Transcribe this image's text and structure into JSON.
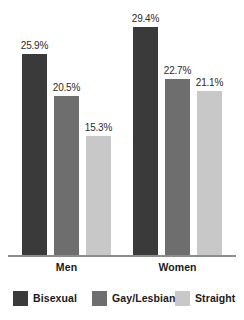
{
  "chart_data": {
    "type": "bar",
    "title": "",
    "subtitle": "",
    "xlabel": "",
    "ylabel": "",
    "categories": [
      "Men",
      "Women"
    ],
    "series": [
      {
        "name": "Bisexual",
        "color": "#3a3a3a",
        "values": [
          25.9,
          20.5
        ],
        "labels": [
          "25.9%",
          "15.3%"
        ]
      },
      {
        "name": "Gay/Lesbian",
        "color": "#6e6e6e",
        "values": [
          20.5,
          22.7
        ],
        "labels": [
          "20.5%",
          "22.7%"
        ]
      },
      {
        "name": "Straight",
        "color": "#c8c8c8",
        "values": [
          15.3,
          21.1
        ],
        "labels": [
          "15.3%",
          "21.1%"
        ]
      }
    ],
    "groups": [
      {
        "category": "Men",
        "bars": [
          {
            "series": "Bisexual",
            "value": 25.9,
            "label": "25.9%",
            "color": "#3a3a3a"
          },
          {
            "series": "Gay/Lesbian",
            "value": 20.5,
            "label": "20.5%",
            "color": "#6e6e6e"
          },
          {
            "series": "Straight",
            "value": 15.3,
            "label": "15.3%",
            "color": "#c8c8c8"
          }
        ]
      },
      {
        "category": "Women",
        "bars": [
          {
            "series": "Bisexual",
            "value": 29.4,
            "label": "29.4%",
            "color": "#3a3a3a"
          },
          {
            "series": "Gay/Lesbian",
            "value": 22.7,
            "label": "22.7%",
            "color": "#6e6e6e"
          },
          {
            "series": "Straight",
            "value": 21.1,
            "label": "21.1%",
            "color": "#c8c8c8"
          }
        ]
      }
    ],
    "ylim": [
      0,
      33
    ],
    "grid": false,
    "value_labels": true,
    "legend_position": "bottom",
    "axis_color": "#8c8c8c",
    "background": "#ffffff"
  },
  "legend": {
    "items": [
      {
        "label": "Bisexual",
        "color": "#3a3a3a"
      },
      {
        "label": "Gay/Lesbian",
        "color": "#6e6e6e"
      },
      {
        "label": "Straight",
        "color": "#c8c8c8"
      }
    ]
  },
  "axis": {
    "category_labels": [
      "Men",
      "Women"
    ]
  }
}
